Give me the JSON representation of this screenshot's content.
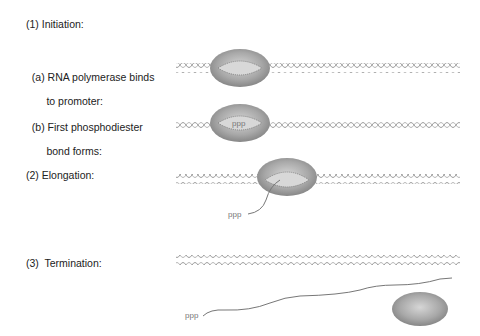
{
  "title": "(1) Initiation:",
  "steps": [
    {
      "id": "a",
      "label_line1": "(a) RNA polymerase binds",
      "label_line2": "     to promoter:"
    },
    {
      "id": "b",
      "label_line1": "(b) First phosphodiester",
      "label_line2": "     bond forms:",
      "annotation": "ppp"
    },
    {
      "id": "elongation",
      "label_line1": "(2) Elongation:",
      "annotation": "ppp"
    },
    {
      "id": "termination",
      "label_line1": "(3)  Termination:",
      "annotation": "ppp"
    }
  ],
  "colors": {
    "dna_strand": "#9a9a9a",
    "polymerase_dark": "#8a8a8a",
    "polymerase_light": "#c8c8c8",
    "rna": "#777777"
  }
}
